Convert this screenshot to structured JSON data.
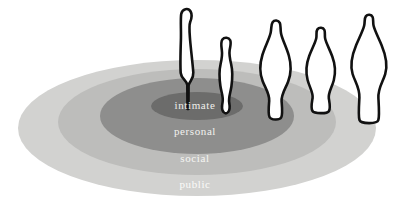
{
  "diagram": {
    "canvas": {
      "width": 397,
      "height": 209
    },
    "background_color": "#ffffff",
    "zones": [
      {
        "id": "public",
        "label": "public",
        "order": 4,
        "fill": "#d2d2d0",
        "label_color": "#fbfbf9",
        "ellipse": {
          "cx": 197,
          "cy": 128,
          "rx": 179,
          "ry": 68
        }
      },
      {
        "id": "social",
        "label": "social",
        "order": 3,
        "fill": "#bdbdbb",
        "label_color": "#f6f6f3",
        "ellipse": {
          "cx": 197,
          "cy": 122,
          "rx": 139,
          "ry": 53
        }
      },
      {
        "id": "personal",
        "label": "personal",
        "order": 2,
        "fill": "#8e8e8d",
        "label_color": "#f2f2ef",
        "ellipse": {
          "cx": 197,
          "cy": 116,
          "rx": 97,
          "ry": 38
        }
      },
      {
        "id": "intimate",
        "label": "intimate",
        "order": 1,
        "fill": "#6c6c6b",
        "label_color": "#efefec",
        "ellipse": {
          "cx": 197,
          "cy": 106,
          "rx": 46,
          "ry": 14
        }
      }
    ],
    "figures": [
      {
        "id": "figure-1",
        "name": "figure-intimate-distance",
        "stroke": "#111111",
        "fill": "#ffffff",
        "stroke_width": 2.6,
        "zone": "intimate",
        "path": "M 187.5 109 L 187.3 85 C 186.6 80 181.3 79 180.7 73 C 180.2 66 180.6 49 180.9 40 C 181.2 31 180.4 19 181.2 14 C 182.2 8.5 188.4 7.5 190.6 11.5 C 192.6 15 191.4 19 190.2 22 C 188.8 25.5 189.4 31 190.1 40 C 190.9 49.5 192.8 65 193.3 72.5 C 193.8 79.5 189.4 80.5 188.6 85.5 L 188.4 109 Z"
      },
      {
        "id": "figure-2",
        "name": "figure-personal-distance-near",
        "stroke": "#111111",
        "fill": "#ffffff",
        "stroke_width": 2.6,
        "zone": "personal",
        "path": "M 223.5 112 C 221.5 110 221.8 106 222.6 102 C 223.6 97 221.2 92 220.4 86 C 219.4 79 219.2 70 220.6 64 C 222.0 58 222.4 54 221.8 50 C 221.2 46 220.6 42 222.4 39.5 C 224.4 36.8 228.8 37.2 230.2 40.2 C 231.4 43 230.2 46.5 229.6 50.5 C 229.0 54.5 229.8 58.5 231.2 64.5 C 232.6 70.5 232.4 79.5 231.4 86.5 C 230.4 93 228.4 97.5 229.2 102.5 C 229.9 106.5 230.0 110 228.2 112 C 226.6 113.8 225.1 113.8 223.5 112 Z"
      },
      {
        "id": "figure-3",
        "name": "figure-personal-distance-far",
        "stroke": "#111111",
        "fill": "#ffffff",
        "stroke_width": 2.6,
        "zone": "social",
        "path": "M 269.5 117 C 268.0 114 268.6 108 269.2 101 C 269.8 94 265.2 88 262.6 81 C 259.8 73.5 259.6 64 262.4 55 C 265.0 46.5 269.2 39 270.6 33 C 271.6 28.5 271.0 24.5 272.6 22.2 C 274.4 19.6 278.4 20.0 279.8 22.8 C 281.0 25.2 280.2 28.8 281.0 33.2 C 282.2 39.5 286.4 47 288.8 55.5 C 291.4 64.5 291.0 74 288.2 81.5 C 285.6 88.5 281.0 94.5 281.6 101.5 C 282.2 108.5 282.8 114.5 281.2 117.5 C 279.6 120.4 271.0 120.2 269.5 117 Z"
      },
      {
        "id": "figure-4",
        "name": "figure-social-distance",
        "stroke": "#111111",
        "fill": "#ffffff",
        "stroke_width": 2.6,
        "zone": "social",
        "path": "M 312.5 111 C 310.6 108 311.8 103 312.6 98 C 313.4 93 309.4 87 307.6 80 C 305.8 73 306.2 64 309.2 56 C 311.8 49 315.2 43 316.2 38.5 C 317.0 34.8 315.8 31.5 317.4 29.4 C 319.2 27.0 323.2 27.4 324.4 30.0 C 325.4 32.2 324.4 35.2 325.2 38.8 C 326.2 43.2 329.6 49.2 332.2 56.2 C 335.2 64.2 335.6 73.2 333.8 80.2 C 332.0 87.2 328.0 93.2 328.8 98.2 C 329.6 103.2 330.8 108.2 328.9 111.2 C 327.2 113.9 314.2 113.8 312.5 111 Z"
      },
      {
        "id": "figure-5",
        "name": "figure-public-distance",
        "stroke": "#111111",
        "fill": "#ffffff",
        "stroke_width": 2.6,
        "zone": "public",
        "path": "M 359.5 120 C 358.2 116 358.8 108 359.4 98 C 360.0 88 355.0 82 352.6 74 C 350.2 66 351.6 56 356.2 45 C 359.6 37 363.2 30 364.2 25.5 C 365.0 21.8 364.2 18.5 365.8 16.4 C 367.6 14.0 371.4 14.4 372.6 17.0 C 373.6 19.2 372.8 22.2 373.6 25.8 C 374.6 30.2 378.2 37.2 381.6 45.2 C 386.2 56.2 387.6 66.2 385.2 74.2 C 382.8 82.2 377.8 88.2 378.4 98.2 C 379.0 108.2 379.6 116.2 378.3 120.2 C 377.0 124.2 360.8 124.0 359.5 120 Z"
      }
    ]
  }
}
